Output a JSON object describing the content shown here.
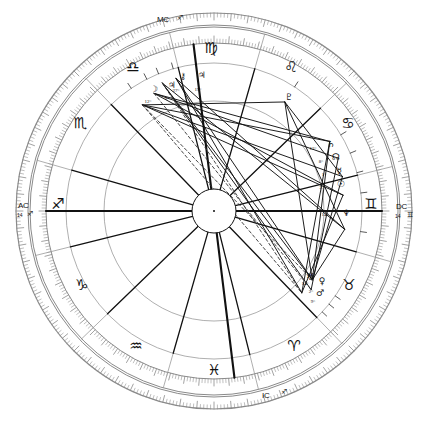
{
  "chart": {
    "type": "horoscope-wheel",
    "center": {
      "x": 214,
      "y": 211
    },
    "radii": {
      "outer_rim_outer": 198,
      "outer_rim_inner": 186,
      "degree_band_outer": 184,
      "degree_band_inner": 168,
      "sign_ring_inner": 148,
      "house_ring": 110,
      "inner_circle": 22
    },
    "colors": {
      "ink": "#111111",
      "rim": "#8a8a8a",
      "grid": "#9a9a9a",
      "aspect_solid": "#111111",
      "aspect_dashed": "#333333",
      "paper": "#ffffff"
    },
    "ascendant_degree": 14,
    "ascendant_sign": "Sagittarius"
  },
  "axes": [
    {
      "name": "MC",
      "label": "MC",
      "degree": "",
      "sign_glyph": "♐",
      "angle_deg": 97,
      "label_x": 157,
      "label_y": 22,
      "glyph_x": 177,
      "glyph_y": 20
    },
    {
      "name": "IC",
      "label": "IC",
      "degree": "",
      "sign_glyph": "♐",
      "angle_deg": 277,
      "label_x": 262,
      "label_y": 398,
      "glyph_x": 281,
      "glyph_y": 394
    },
    {
      "name": "AC",
      "label": "AC",
      "degree": "14",
      "sign_glyph": "♐",
      "angle_deg": 180,
      "label_x": 18,
      "label_y": 208,
      "glyph_x": 27,
      "glyph_y": 216,
      "deg_x": 17,
      "deg_y": 217
    },
    {
      "name": "DC",
      "label": "DC",
      "degree": "14",
      "sign_glyph": "♊",
      "angle_deg": 0,
      "label_x": 396,
      "label_y": 209,
      "glyph_x": 407,
      "glyph_y": 217,
      "deg_x": 395,
      "deg_y": 218
    }
  ],
  "zodiac_signs": [
    {
      "name": "Virgo",
      "glyph": "♍",
      "x": 211,
      "y": 53,
      "cusp_deg": 104
    },
    {
      "name": "Leo",
      "glyph": "♌",
      "x": 291,
      "y": 72,
      "cusp_deg": 74
    },
    {
      "name": "Cancer",
      "glyph": "♋",
      "x": 348,
      "y": 128,
      "cusp_deg": 44
    },
    {
      "name": "Gemini",
      "glyph": "♊",
      "x": 371,
      "y": 209,
      "cusp_deg": 14
    },
    {
      "name": "Taurus",
      "glyph": "♉",
      "x": 349,
      "y": 290,
      "cusp_deg": 344
    },
    {
      "name": "Aries",
      "glyph": "♈",
      "x": 294,
      "y": 351,
      "cusp_deg": 314
    },
    {
      "name": "Pisces",
      "glyph": "♓",
      "x": 214,
      "y": 375,
      "cusp_deg": 284
    },
    {
      "name": "Aquarius",
      "glyph": "♒",
      "x": 136,
      "y": 351,
      "cusp_deg": 254
    },
    {
      "name": "Capricorn",
      "glyph": "♑",
      "x": 82,
      "y": 290,
      "cusp_deg": 224
    },
    {
      "name": "Sagittarius",
      "glyph": "♐",
      "x": 58,
      "y": 209,
      "cusp_deg": 194
    },
    {
      "name": "Scorpio",
      "glyph": "♏",
      "x": 80,
      "y": 128,
      "cusp_deg": 164
    },
    {
      "name": "Libra",
      "glyph": "♎",
      "x": 133,
      "y": 72,
      "cusp_deg": 134
    }
  ],
  "planets": [
    {
      "name": "Moon",
      "glyph": "☽",
      "degree": "12",
      "minute": "°",
      "x": 154,
      "y": 92,
      "deg_x": 148,
      "deg_y": 103,
      "angle_deg": 124,
      "radius": 128
    },
    {
      "name": "Jupiter",
      "glyph": "♃",
      "degree": "9",
      "minute": "°",
      "x": 172,
      "y": 88,
      "deg_x": 167,
      "deg_y": 100,
      "angle_deg": 117,
      "radius": 132
    },
    {
      "name": "Chiron",
      "glyph": "⚷",
      "degree": "27",
      "minute": "°",
      "x": 183,
      "y": 79,
      "deg_x": 176,
      "deg_y": 92,
      "angle_deg": 112,
      "radius": 138
    },
    {
      "name": "Jupiter2",
      "glyph": "♃",
      "degree": "19",
      "minute": "°",
      "x": 202,
      "y": 78,
      "deg_x": 198,
      "deg_y": 91,
      "angle_deg": 106,
      "radius": 138
    },
    {
      "name": "Pluto",
      "glyph": "♇",
      "degree": "",
      "minute": "",
      "x": 289,
      "y": 100,
      "deg_x": 286,
      "deg_y": 111,
      "angle_deg": 57,
      "radius": 130
    },
    {
      "name": "Saturn",
      "glyph": "♄",
      "degree": "12",
      "minute": "°",
      "x": 331,
      "y": 147,
      "deg_x": 313,
      "deg_y": 150,
      "angle_deg": 31,
      "radius": 135
    },
    {
      "name": "North Node",
      "glyph": "☊",
      "degree": "8",
      "minute": "°",
      "x": 336,
      "y": 160,
      "deg_x": 321,
      "deg_y": 163,
      "angle_deg": 23,
      "radius": 135
    },
    {
      "name": "Mercury",
      "glyph": "☿",
      "degree": "1",
      "minute": "°",
      "x": 339,
      "y": 174,
      "deg_x": 324,
      "deg_y": 176,
      "angle_deg": 15,
      "radius": 133
    },
    {
      "name": "Sun",
      "glyph": "☉",
      "degree": "27",
      "minute": "°",
      "x": 341,
      "y": 187,
      "deg_x": 323,
      "deg_y": 189,
      "angle_deg": 7,
      "radius": 130
    },
    {
      "name": "Neptune",
      "glyph": "♆",
      "degree": "14",
      "minute": "°",
      "x": 346,
      "y": 216,
      "deg_x": 325,
      "deg_y": 216,
      "angle_deg": 352,
      "radius": 132
    },
    {
      "name": "Uranus",
      "glyph": "♅",
      "degree": "14",
      "minute": "°",
      "x": 310,
      "y": 280,
      "deg_x": 305,
      "deg_y": 285,
      "angle_deg": 325,
      "radius": 120
    },
    {
      "name": "Venus",
      "glyph": "♀",
      "degree": "2",
      "minute": "°",
      "x": 322,
      "y": 284,
      "deg_x": 311,
      "deg_y": 293,
      "angle_deg": 321,
      "radius": 125
    },
    {
      "name": "Mars",
      "glyph": "♂",
      "degree": "9",
      "minute": "°",
      "x": 320,
      "y": 296,
      "deg_x": 313,
      "deg_y": 303,
      "angle_deg": 317,
      "radius": 120
    }
  ],
  "house_cusp_angles": [
    194,
    224,
    254,
    284,
    314,
    344,
    14,
    44,
    74,
    104,
    134,
    164
  ],
  "aspect_lines_solid": [
    [
      124,
      128,
      31,
      135
    ],
    [
      124,
      128,
      15,
      133
    ],
    [
      124,
      128,
      7,
      130
    ],
    [
      117,
      132,
      31,
      135
    ],
    [
      117,
      132,
      23,
      135
    ],
    [
      112,
      138,
      325,
      120
    ],
    [
      112,
      138,
      321,
      125
    ],
    [
      106,
      138,
      325,
      120
    ],
    [
      106,
      138,
      317,
      120
    ],
    [
      106,
      138,
      352,
      132
    ],
    [
      57,
      130,
      325,
      120
    ],
    [
      57,
      130,
      352,
      132
    ],
    [
      57,
      130,
      15,
      133
    ],
    [
      31,
      135,
      325,
      120
    ],
    [
      31,
      135,
      317,
      120
    ],
    [
      23,
      135,
      321,
      125
    ],
    [
      15,
      133,
      325,
      120
    ],
    [
      7,
      130,
      317,
      120
    ],
    [
      352,
      132,
      325,
      120
    ],
    [
      124,
      128,
      57,
      130
    ],
    [
      117,
      132,
      7,
      130
    ],
    [
      112,
      138,
      352,
      132
    ]
  ],
  "aspect_lines_dashed": [
    [
      124,
      128,
      325,
      120
    ],
    [
      117,
      132,
      321,
      125
    ],
    [
      112,
      138,
      317,
      120
    ],
    [
      124,
      128,
      317,
      120
    ]
  ],
  "spoke_angles": [
    194,
    224,
    254,
    284,
    314,
    344,
    14,
    44,
    74,
    104,
    134,
    164,
    180,
    0,
    97,
    277
  ]
}
